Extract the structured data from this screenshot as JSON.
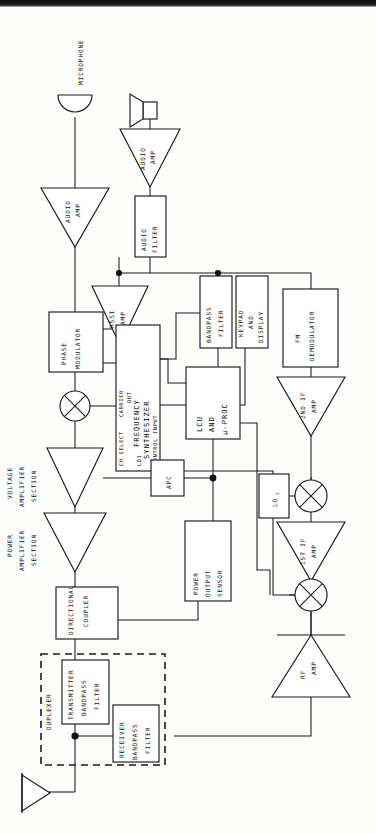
{
  "diagram": {
    "orientation": "rotated-90-ccw",
    "line_color": "#1a1a1a",
    "background": "#fdfdfc",
    "scan_edge_color": "#111111"
  },
  "labels": {
    "microphone": "MICROPHONE",
    "audio_amp_tx": "AUDIO\nAMP",
    "audio_amp_rx": "AUDIO\nAMP",
    "audio_amp_line1": "AUDIO",
    "audio_amp_line2": "AMP",
    "audio_filter_line1": "AUDIO",
    "audio_filter_line2": "FILTER",
    "rssi_amp_line1": "RSSI",
    "rssi_amp_line2": "AMP",
    "phase_mod_line1": "PHASE",
    "phase_mod_line2": "MODULATOR",
    "synth_ch_select": "CH SELECT",
    "synth_carrier_out_line1": "CARRIER",
    "synth_carrier_out_line2": "OUT",
    "synth_name_line1": "FREQUENCY",
    "synth_name_line2": "SYNTHESIZER",
    "synth_lo1": "LO1",
    "synth_control_input": "CONTROL INPUT",
    "lcu_line1": "LCU",
    "lcu_line2": "AND",
    "lcu_line3": "µ-PROC",
    "bandpass_filter_line1": "BANDPASS",
    "bandpass_filter_line2": "FILTER",
    "keypad_line1": "KEYPAD",
    "keypad_line2": "AND",
    "keypad_line3": "DISPLAY",
    "fm_demod_line1": "FM",
    "fm_demod_line2": "DEMODULATOR",
    "second_if_line1": "2ND IF",
    "second_if_line2": "AMP",
    "first_if_line1": "1ST IF",
    "first_if_line2": "AMP",
    "lo2": "LO",
    "lo2_sub": "2",
    "rf_amp_line1": "RF",
    "rf_amp_line2": "AMP",
    "apc": "APC",
    "power_sensor_line1": "POWER",
    "power_sensor_line2": "OUTPUT",
    "power_sensor_line3": "SENSOR",
    "dir_coupler_line1": "DIRECTIONAL",
    "dir_coupler_line2": "COUPLER",
    "duplexer": "DUPLEXER",
    "tx_bpf_line1": "TRANSMITTER",
    "tx_bpf_line2": "BANDPASS",
    "tx_bpf_line3": "FILTER",
    "rx_bpf_line1": "RECEIVER",
    "rx_bpf_line2": "BANDPASS",
    "rx_bpf_line3": "FILTER",
    "volt_amp_line1": "VOLTAGE",
    "volt_amp_line2": "AMPLIFIER",
    "volt_amp_line3": "SECTION",
    "pwr_amp_line1": "POWER",
    "pwr_amp_line2": "AMPLIFIER",
    "pwr_amp_line3": "SECTION"
  },
  "blocks": [
    {
      "id": "microphone",
      "name": "microphone-transducer",
      "type": "transducer"
    },
    {
      "id": "audio-amp-tx",
      "name": "audio-amp-transmit",
      "type": "triangle-amp"
    },
    {
      "id": "phase-modulator",
      "name": "phase-modulator",
      "type": "box"
    },
    {
      "id": "tx-mixer",
      "name": "transmit-mixer",
      "type": "mixer"
    },
    {
      "id": "frequency-synthesizer",
      "name": "frequency-synthesizer",
      "type": "box"
    },
    {
      "id": "voltage-amp",
      "name": "voltage-amplifier-section",
      "type": "triangle-amp"
    },
    {
      "id": "power-amp",
      "name": "power-amplifier-section",
      "type": "triangle-amp"
    },
    {
      "id": "apc",
      "name": "apc-block",
      "type": "box"
    },
    {
      "id": "power-output-sensor",
      "name": "power-output-sensor",
      "type": "box"
    },
    {
      "id": "directional-coupler",
      "name": "directional-coupler",
      "type": "box"
    },
    {
      "id": "transmitter-bandpass-filter",
      "name": "transmitter-bandpass-filter",
      "type": "box"
    },
    {
      "id": "receiver-bandpass-filter",
      "name": "receiver-bandpass-filter",
      "type": "box"
    },
    {
      "id": "duplexer",
      "name": "duplexer-enclosure",
      "type": "dashed-group"
    },
    {
      "id": "antenna",
      "name": "antenna-symbol",
      "type": "antenna"
    },
    {
      "id": "rf-amp",
      "name": "rf-amplifier",
      "type": "triangle-amp"
    },
    {
      "id": "rx-mixer",
      "name": "receive-mixer",
      "type": "mixer"
    },
    {
      "id": "first-if-amp",
      "name": "first-if-amplifier",
      "type": "triangle-amp"
    },
    {
      "id": "lo2",
      "name": "local-oscillator-2",
      "type": "box"
    },
    {
      "id": "second-if-amp",
      "name": "second-if-amplifier",
      "type": "triangle-amp"
    },
    {
      "id": "fm-demodulator",
      "name": "fm-demodulator",
      "type": "box"
    },
    {
      "id": "bandpass-filter",
      "name": "bandpass-filter",
      "type": "box"
    },
    {
      "id": "keypad-and-display",
      "name": "keypad-and-display",
      "type": "box"
    },
    {
      "id": "lcu-and-uproc",
      "name": "lcu-and-microprocessor",
      "type": "box"
    },
    {
      "id": "rssi-amp",
      "name": "rssi-amplifier",
      "type": "triangle-amp"
    },
    {
      "id": "audio-filter",
      "name": "audio-filter",
      "type": "box"
    },
    {
      "id": "audio-amp-rx",
      "name": "audio-amp-receive",
      "type": "triangle-amp"
    },
    {
      "id": "speaker",
      "name": "speaker-transducer",
      "type": "transducer"
    }
  ]
}
